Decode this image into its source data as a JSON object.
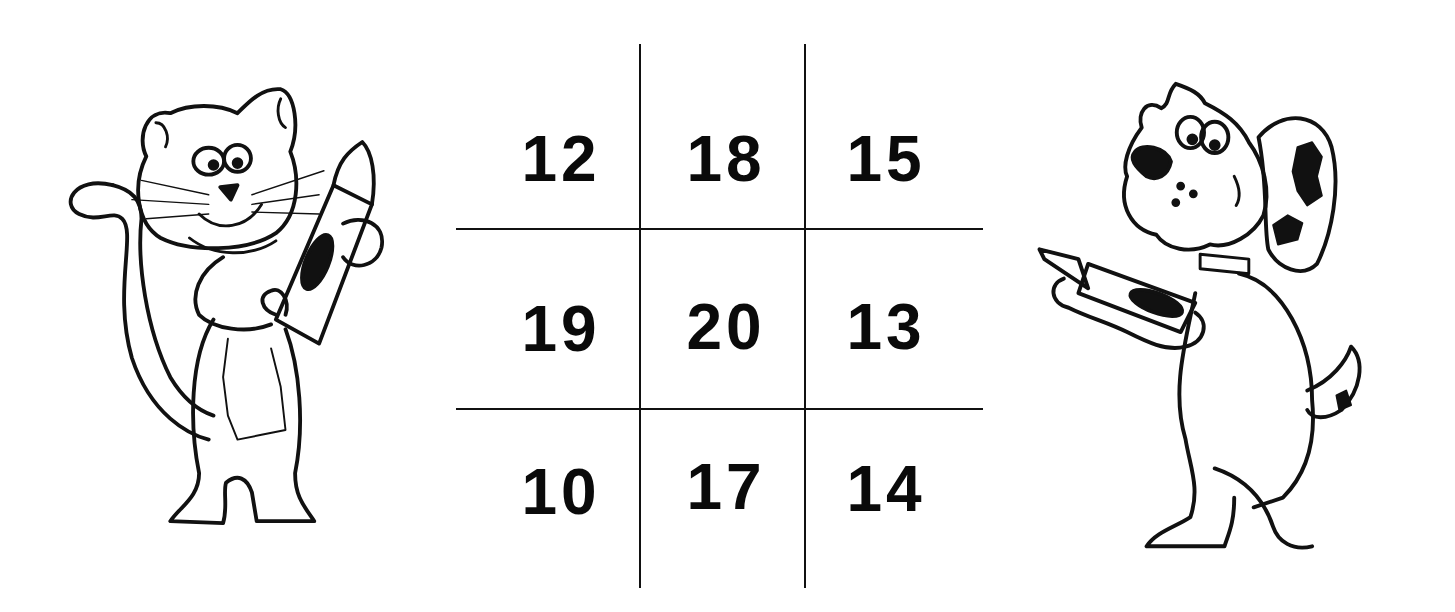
{
  "worksheet": {
    "grid": {
      "rows": [
        [
          "12",
          "18",
          "15"
        ],
        [
          "19",
          "20",
          "13"
        ],
        [
          "10",
          "17",
          "14"
        ]
      ]
    },
    "illustrations": {
      "left": "cat-holding-crayon",
      "right": "dog-holding-crayon"
    },
    "colors": {
      "ink": "#0a0a0a",
      "background": "#ffffff"
    }
  }
}
